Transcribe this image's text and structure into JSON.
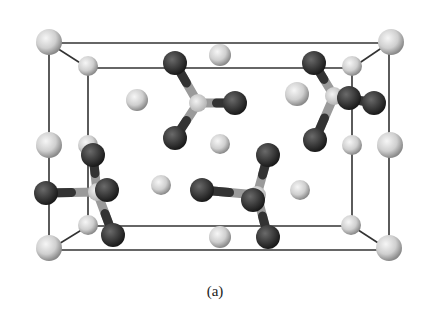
{
  "figure": {
    "caption": "(a)",
    "colors": {
      "background": "#ffffff",
      "cell_edge": "#333333",
      "cation_light": "#d8d8d8",
      "anion_dark": "#3a3a3a",
      "center_atom": "#e4e4e4"
    },
    "cell": {
      "outer": {
        "x1": 49,
        "y1": 43,
        "x2": 389,
        "y2": 250
      },
      "inner": {
        "x1": 88,
        "y1": 68,
        "x2": 352,
        "y2": 226
      }
    },
    "light_spheres": [
      {
        "x": 49,
        "y": 42,
        "r": 13
      },
      {
        "x": 391,
        "y": 42,
        "r": 13
      },
      {
        "x": 49,
        "y": 248,
        "r": 13
      },
      {
        "x": 389,
        "y": 248,
        "r": 13
      },
      {
        "x": 88,
        "y": 66,
        "r": 10
      },
      {
        "x": 352,
        "y": 66,
        "r": 10
      },
      {
        "x": 88,
        "y": 225,
        "r": 10
      },
      {
        "x": 351,
        "y": 225,
        "r": 10
      },
      {
        "x": 49,
        "y": 145,
        "r": 13
      },
      {
        "x": 88,
        "y": 145,
        "r": 10
      },
      {
        "x": 390,
        "y": 145,
        "r": 13
      },
      {
        "x": 352,
        "y": 145,
        "r": 10
      },
      {
        "x": 137,
        "y": 100,
        "r": 11
      },
      {
        "x": 220,
        "y": 55,
        "r": 11
      },
      {
        "x": 297,
        "y": 94,
        "r": 12
      },
      {
        "x": 220,
        "y": 144,
        "r": 10
      },
      {
        "x": 161,
        "y": 185,
        "r": 10
      },
      {
        "x": 300,
        "y": 190,
        "r": 10
      },
      {
        "x": 220,
        "y": 237,
        "r": 11
      }
    ],
    "molecules": [
      {
        "center": {
          "x": 198,
          "y": 103
        },
        "arms": [
          {
            "x": 175,
            "y": 63
          },
          {
            "x": 235,
            "y": 103
          },
          {
            "x": 175,
            "y": 138
          }
        ]
      },
      {
        "center": {
          "x": 334,
          "y": 96
        },
        "arms": [
          {
            "x": 314,
            "y": 63
          },
          {
            "x": 374,
            "y": 103
          },
          {
            "x": 315,
            "y": 140
          },
          {
            "x": 349,
            "y": 98
          }
        ]
      },
      {
        "center": {
          "x": 257,
          "y": 195
        },
        "arms": [
          {
            "x": 268,
            "y": 155
          },
          {
            "x": 202,
            "y": 190
          },
          {
            "x": 268,
            "y": 237
          },
          {
            "x": 253,
            "y": 200
          }
        ]
      },
      {
        "center": {
          "x": 97,
          "y": 192
        },
        "arms": [
          {
            "x": 93,
            "y": 155
          },
          {
            "x": 46,
            "y": 193
          },
          {
            "x": 113,
            "y": 235
          },
          {
            "x": 107,
            "y": 190
          }
        ]
      }
    ]
  }
}
